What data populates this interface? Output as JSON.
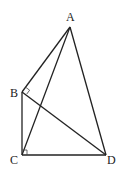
{
  "diagram": {
    "type": "geometry",
    "points": {
      "A": {
        "label": "A",
        "x": 70,
        "y": 27
      },
      "B": {
        "label": "B",
        "x": 22,
        "y": 92
      },
      "C": {
        "label": "C",
        "x": 22,
        "y": 155
      },
      "D": {
        "label": "D",
        "x": 106,
        "y": 155
      }
    },
    "segments": [
      "AB",
      "AC",
      "AD",
      "BC",
      "BD",
      "CD"
    ],
    "right_angles": [
      "ABD",
      "BCD"
    ],
    "colors": {
      "stroke": "#222222",
      "background": "#ffffff"
    }
  }
}
